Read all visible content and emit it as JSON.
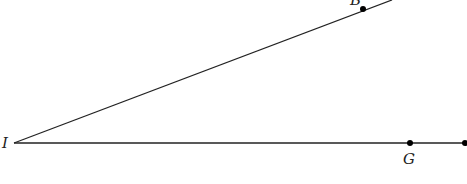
{
  "diagram": {
    "type": "angle",
    "vertex": {
      "label": "I",
      "x": 14,
      "y": 143
    },
    "rays": [
      {
        "name": "ray-IB",
        "through": {
          "label": "B",
          "x": 363,
          "y": 9
        },
        "end": {
          "x": 390,
          "y": 0
        }
      },
      {
        "name": "ray-IG",
        "through": {
          "label": "G",
          "x": 410,
          "y": 143
        },
        "end": {
          "x": 465,
          "y": 143
        }
      }
    ],
    "labels": {
      "vertex": "I",
      "upper_point": "B",
      "lower_point": "G"
    },
    "colors": {
      "line": "#222222",
      "point": "#000000"
    }
  }
}
